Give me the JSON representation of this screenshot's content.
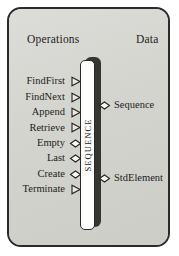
{
  "diagram": {
    "title": "SEQUENCE",
    "headings": {
      "operations": "Operations",
      "data": "Data"
    },
    "module": {
      "name": "SEQUENCE",
      "orientation": "vertical-bar"
    },
    "operations": [
      {
        "label": "FindFirst",
        "connector": "triangle-icon"
      },
      {
        "label": "FindNext",
        "connector": "triangle-icon"
      },
      {
        "label": "Append",
        "connector": "triangle-icon"
      },
      {
        "label": "Retrieve",
        "connector": "triangle-icon"
      },
      {
        "label": "Empty",
        "connector": "diamond-icon"
      },
      {
        "label": "Last",
        "connector": "diamond-icon"
      },
      {
        "label": "Create",
        "connector": "diamond-icon"
      },
      {
        "label": "Terminate",
        "connector": "triangle-icon"
      }
    ],
    "data_items": [
      {
        "label": "Sequence",
        "connector": "diamond-icon"
      },
      {
        "label": "StdElement",
        "connector": "diamond-icon"
      }
    ],
    "colors": {
      "frame_background": "#d6d6d2",
      "frame_border": "#2b2a28",
      "bar_face": "#fdfdfb",
      "bar_shadow": "#36352f",
      "text": "#1d1c1b",
      "page_background": "#ffffff"
    }
  }
}
